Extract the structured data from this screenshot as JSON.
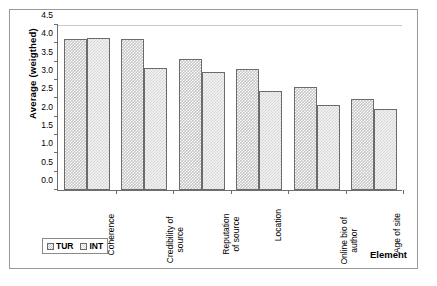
{
  "chart_data": {
    "type": "bar",
    "title": "",
    "xlabel": "Element",
    "ylabel": "Average (weigthed)",
    "ylim": [
      0.0,
      4.5
    ],
    "yticks": [
      "0.0",
      "0.5",
      "1.0",
      "1.5",
      "2.0",
      "2.5",
      "3.0",
      "3.5",
      "4.0",
      "4.5"
    ],
    "ytick_values": [
      0.0,
      0.5,
      1.0,
      1.5,
      2.0,
      2.5,
      3.0,
      3.5,
      4.0,
      4.5
    ],
    "grid": false,
    "legend_position": "bottom-left",
    "categories": [
      "Coherence",
      "Credibility of source",
      "Reputation of source",
      "Location",
      "Online bio of author",
      "Age of site"
    ],
    "series": [
      {
        "name": "TUR",
        "color": "#c7c7c7",
        "values": [
          4.12,
          4.11,
          3.56,
          3.31,
          2.82,
          2.49
        ]
      },
      {
        "name": "INT",
        "color": "#f2f2f2",
        "values": [
          4.14,
          3.33,
          3.21,
          2.71,
          2.33,
          2.21
        ]
      }
    ]
  },
  "legend": {
    "entries": [
      {
        "label": "TUR",
        "swatch": "tur-swatch-icon"
      },
      {
        "label": "INT",
        "swatch": "int-swatch-icon"
      }
    ]
  }
}
